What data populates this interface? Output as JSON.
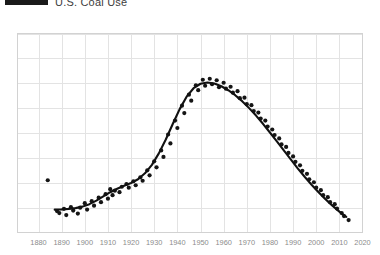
{
  "legend": {
    "series_label": "U.S. Coal Use",
    "swatch_color": "#1a1a1a",
    "swatch_name": "legend-line-swatch"
  },
  "axis": {
    "x_tick_labels": [
      "1880",
      "1890",
      "1900",
      "1910",
      "1920",
      "1930",
      "1940",
      "1950",
      "1960",
      "1970",
      "1980",
      "1990",
      "2000",
      "2010",
      "2020"
    ],
    "grid_color": "#e3e3e3",
    "frame_color": "#d2d2d2",
    "tick_label_color": "#8c8c8c"
  },
  "chart_data": {
    "type": "scatter",
    "title": "",
    "subtitle": "",
    "xlabel": "",
    "ylabel": "",
    "xlim": [
      1880,
      2020
    ],
    "ylim": [
      0,
      8
    ],
    "grid": true,
    "legend_position": "top-left",
    "xticks": [
      1880,
      1890,
      1900,
      1910,
      1920,
      1930,
      1940,
      1950,
      1960,
      1970,
      1980,
      1990,
      2000,
      2010,
      2020
    ],
    "yticks": [
      0,
      1,
      2,
      3,
      4,
      5,
      6,
      7,
      8
    ],
    "ytick_labels_visible": false,
    "series": [
      {
        "name": "U.S. Coal Use",
        "type": "line",
        "color": "#111111",
        "smoothed": true,
        "x": [
          1887,
          1890,
          1893,
          1896,
          1899,
          1902,
          1905,
          1908,
          1911,
          1914,
          1917,
          1920,
          1923,
          1926,
          1929,
          1932,
          1935,
          1938,
          1941,
          1944,
          1947,
          1950,
          1953,
          1956,
          1959,
          1962,
          1965,
          1968,
          1971,
          1974,
          1977,
          1980,
          1983,
          1986,
          1989,
          1992,
          1995,
          1998,
          2001,
          2004,
          2007,
          2010,
          2013
        ],
        "y": [
          0.92,
          0.93,
          0.95,
          0.98,
          1.04,
          1.14,
          1.28,
          1.45,
          1.62,
          1.76,
          1.88,
          1.99,
          2.14,
          2.38,
          2.72,
          3.18,
          3.74,
          4.36,
          4.96,
          5.46,
          5.8,
          5.98,
          6.03,
          5.99,
          5.88,
          5.72,
          5.52,
          5.28,
          5.0,
          4.7,
          4.37,
          4.02,
          3.66,
          3.3,
          2.94,
          2.58,
          2.24,
          1.92,
          1.62,
          1.34,
          1.08,
          0.84,
          0.63
        ]
      },
      {
        "name": "Observations",
        "type": "scatter",
        "color": "#151515",
        "marker_size": 2.1,
        "x": [
          1884,
          1888,
          1889,
          1891,
          1892,
          1894,
          1895,
          1897,
          1898,
          1900,
          1901,
          1903,
          1904,
          1906,
          1907,
          1909,
          1910,
          1911,
          1912,
          1913,
          1915,
          1916,
          1918,
          1919,
          1921,
          1922,
          1924,
          1925,
          1927,
          1928,
          1930,
          1931,
          1933,
          1934,
          1936,
          1937,
          1939,
          1940,
          1942,
          1943,
          1945,
          1946,
          1948,
          1949,
          1951,
          1952,
          1954,
          1955,
          1957,
          1958,
          1960,
          1961,
          1963,
          1964,
          1966,
          1967,
          1969,
          1970,
          1972,
          1973,
          1975,
          1976,
          1978,
          1979,
          1981,
          1982,
          1984,
          1985,
          1987,
          1988,
          1990,
          1991,
          1993,
          1994,
          1996,
          1997,
          1999,
          2000,
          2002,
          2003,
          2005,
          2006,
          2008,
          2009,
          2011,
          2012,
          2014
        ],
        "y": [
          2.1,
          0.86,
          0.78,
          0.95,
          0.7,
          1.02,
          0.88,
          0.76,
          1.0,
          1.18,
          0.92,
          1.26,
          1.08,
          1.4,
          1.22,
          1.54,
          1.36,
          1.74,
          1.5,
          1.68,
          1.62,
          1.84,
          1.95,
          1.8,
          2.06,
          1.9,
          2.22,
          2.08,
          2.5,
          2.3,
          2.86,
          2.62,
          3.3,
          3.04,
          3.94,
          3.58,
          4.5,
          4.2,
          5.1,
          4.8,
          5.54,
          5.3,
          5.92,
          5.72,
          6.14,
          5.9,
          6.18,
          5.96,
          6.12,
          5.84,
          6.02,
          5.78,
          5.86,
          5.62,
          5.68,
          5.4,
          5.42,
          5.16,
          5.12,
          4.88,
          4.82,
          4.58,
          4.5,
          4.26,
          4.14,
          3.92,
          3.78,
          3.54,
          3.44,
          3.2,
          3.06,
          2.84,
          2.7,
          2.48,
          2.36,
          2.14,
          2.02,
          1.8,
          1.7,
          1.5,
          1.42,
          1.22,
          1.14,
          0.96,
          0.78,
          0.66,
          0.5
        ]
      }
    ]
  }
}
